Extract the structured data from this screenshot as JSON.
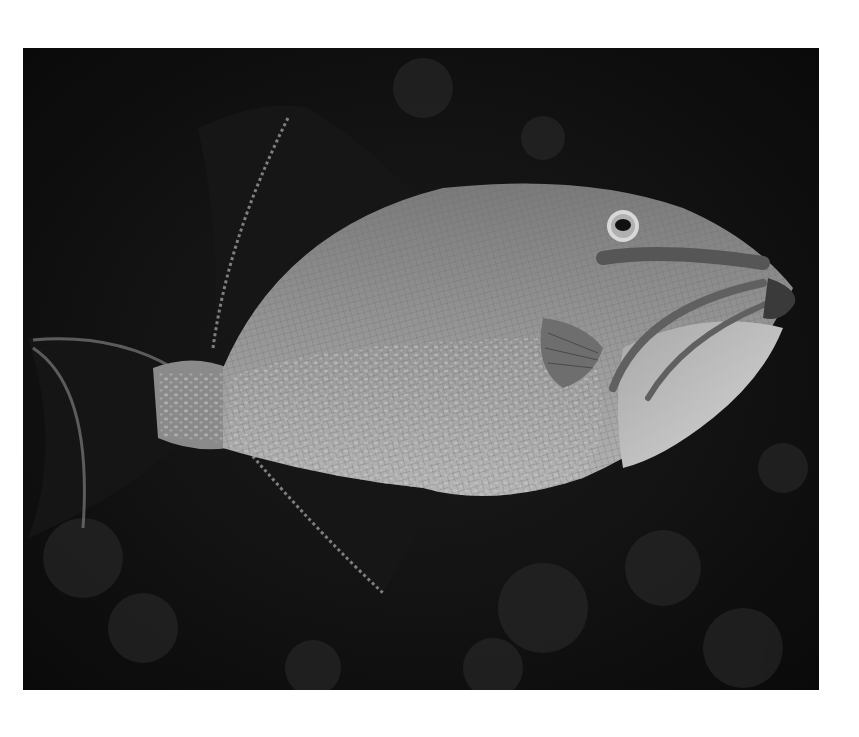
{
  "image": {
    "subject": "Triggerfish swimming against dark reef background",
    "style": "grayscale underwater photograph",
    "frame": {
      "background": "#ffffff",
      "photo_left": 23,
      "photo_top": 48,
      "photo_width": 796,
      "photo_height": 642
    },
    "colors": {
      "background_dark": "#0e0e0e",
      "body_mid": "#8a8a8a",
      "belly_light": "#c8c8c8",
      "fin_dark": "#1a1a1a",
      "stripe": "#555555"
    }
  }
}
